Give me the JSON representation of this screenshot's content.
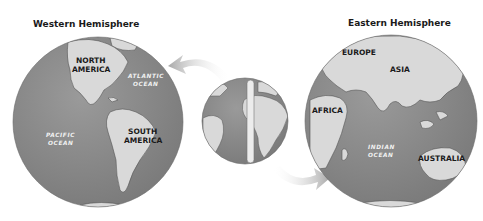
{
  "titles": {
    "western": "Western Hemisphere",
    "eastern": "Eastern Hemisphere"
  },
  "western": {
    "continents": [
      {
        "line1": "NORTH",
        "line2": "AMERICA"
      },
      {
        "line1": "SOUTH",
        "line2": "AMERICA"
      }
    ],
    "oceans": [
      {
        "line1": "ATLANTIC",
        "line2": "OCEAN"
      },
      {
        "line1": "PACIFIC",
        "line2": "OCEAN"
      }
    ]
  },
  "eastern": {
    "continents": [
      "EUROPE",
      "ASIA",
      "AFRICA",
      "AUSTRALIA"
    ],
    "oceans": [
      {
        "line1": "INDIAN",
        "line2": "OCEAN"
      }
    ]
  },
  "colors": {
    "ocean": "#8a8a8a",
    "land": "#d9d9d9",
    "arrow": "#b5b5b5",
    "text": "#1a1a1a"
  }
}
